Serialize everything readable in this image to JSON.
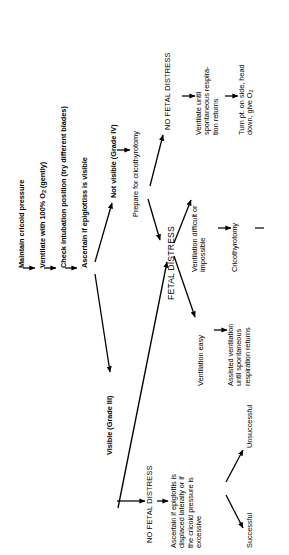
{
  "figure": {
    "kind": "clinical-algorithm-flowchart",
    "orientation": "text rotated 90 degrees counter-clockwise (landscape figure on a portrait page)",
    "ink_color": "#000000",
    "background_color": "#ffffff"
  },
  "nodes": {
    "maintain_cricoid": "Maintain cricoid pressure",
    "ventilate_100": "Ventilate with 100% O",
    "ventilate_100_sub": "2",
    "ventilate_100_tail": " (gently)",
    "check_intubation": "Check intubation position (try different blades)",
    "ascertain_epiglottis": "Ascertain if epiglottiss is visible",
    "not_visible": "Not visible (Grade IV)",
    "visible": "Visible (Grade III)",
    "prepare_crico": "Prepare for cricothyrotomy",
    "no_fetal_distress_top": "NO FETAL DISTRESS",
    "ventilate_until_l1": "Ventilate until",
    "ventilate_until_l2": "spontaneous respira-",
    "ventilate_until_l3": "tion returns",
    "turn_pt_l1": "Turn pt. on side, head",
    "turn_pt_l2": "down, give O",
    "turn_pt_sub": "2",
    "fetal_distress": "FETAL DISTRESS",
    "vent_difficult_l1": "Ventilation difficult or",
    "vent_difficult_l2": "impossible",
    "cricothyrotomy": "Cricothyrotomy",
    "cricothyrotomy_tail_mark": "—",
    "ventilation_easy": "Ventilation easy",
    "assisted_vent_l1": "Assisted ventilation",
    "assisted_vent_l2": "until spontaneous",
    "assisted_vent_l3": "respiration returns",
    "no_fetal_distress_bottom": "NO FETAL DISTRESS",
    "ascertain_displaced_l1": "Ascertain if epiglottis is",
    "ascertain_displaced_l2": "displaced laterally or if",
    "ascertain_displaced_l3": "the cricoid pressure is",
    "ascertain_displaced_l4": "excessive",
    "successful": "Successful",
    "unsuccessful": "Unsuccessful"
  },
  "edges": [
    {
      "from": "maintain_cricoid",
      "to": "ventilate_100",
      "style": "arrow"
    },
    {
      "from": "ventilate_100",
      "to": "check_intubation",
      "style": "arrow"
    },
    {
      "from": "check_intubation",
      "to": "ascertain_epiglottis",
      "style": "arrow"
    },
    {
      "from": "ascertain_epiglottis",
      "to": "not_visible",
      "style": "arrow-diagonal-up"
    },
    {
      "from": "ascertain_epiglottis",
      "to": "visible",
      "style": "arrow-diagonal-down"
    },
    {
      "from": "not_visible",
      "to": "prepare_crico",
      "style": "arrow"
    },
    {
      "from": "prepare_crico",
      "to": "no_fetal_distress_top",
      "style": "arrow-diagonal-up"
    },
    {
      "from": "prepare_crico",
      "to": "fetal_distress",
      "style": "arrow-diagonal-down"
    },
    {
      "from": "no_fetal_distress_top",
      "to": "ventilate_until_l1",
      "style": "arrow"
    },
    {
      "from": "ventilate_until_l1",
      "to": "turn_pt_l1",
      "style": "arrow"
    },
    {
      "from": "fetal_distress",
      "to": "vent_difficult_l1",
      "style": "arrow-diagonal-up"
    },
    {
      "from": "fetal_distress",
      "to": "ventilation_easy",
      "style": "arrow-diagonal-down"
    },
    {
      "from": "vent_difficult_l2",
      "to": "cricothyrotomy",
      "style": "arrow"
    },
    {
      "from": "ventilation_easy",
      "to": "assisted_vent_l1",
      "style": "arrow"
    },
    {
      "from": "visible",
      "to": "no_fetal_distress_bottom",
      "style": "arrow"
    },
    {
      "from": "no_fetal_distress_bottom",
      "to": "ascertain_displaced_l1",
      "style": "arrow"
    },
    {
      "from": "ascertain_displaced_l4",
      "to": "successful",
      "style": "arrow-branch-down"
    },
    {
      "from": "ascertain_displaced_l4",
      "to": "unsuccessful",
      "style": "arrow-branch-up"
    },
    {
      "from": "unsuccessful",
      "to": "fetal_distress",
      "style": "arrow-long-feedback"
    }
  ]
}
